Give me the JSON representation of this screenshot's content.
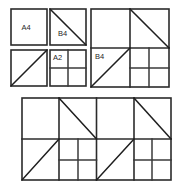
{
  "figure": {
    "background_color": "#ffffff",
    "stroke_color": "#2b2b2b",
    "label_color": "#262626",
    "width": 179,
    "height": 191,
    "labels": {
      "a4": "A4",
      "b4_small": "B4",
      "a2": "A2",
      "b4_large": "B4"
    },
    "groups": [
      {
        "name": "top-left-group",
        "cells": [
          {
            "name": "a4-square",
            "label": "A4",
            "diagonal": "none"
          },
          {
            "name": "b4-small-square",
            "label": "B4",
            "diagonal": "tl-br"
          },
          {
            "name": "plain-diagonal-square",
            "label": "",
            "diagonal": "bl-tr"
          },
          {
            "name": "a2-square",
            "label": "A2",
            "diagonal": "none",
            "subdivision": "quad"
          }
        ]
      },
      {
        "name": "b4-large-group",
        "cells": [
          {
            "name": "quadrant-top-left",
            "label": "",
            "diagonal": "none"
          },
          {
            "name": "quadrant-top-right",
            "label": "",
            "diagonal": "tl-br"
          },
          {
            "name": "quadrant-bottom-left",
            "label": "B4",
            "diagonal": "bl-tr"
          },
          {
            "name": "quadrant-bottom-right",
            "label": "",
            "diagonal": "none",
            "subdivision": "quad-partial"
          }
        ]
      },
      {
        "name": "bottom-panel-left-half",
        "cells": [
          {
            "name": "quadrant-top-left",
            "label": "",
            "diagonal": "none"
          },
          {
            "name": "quadrant-top-right",
            "label": "",
            "diagonal": "tl-br"
          },
          {
            "name": "quadrant-bottom-left",
            "label": "",
            "diagonal": "bl-tr"
          },
          {
            "name": "quadrant-bottom-right",
            "label": "",
            "diagonal": "none",
            "subdivision": "quad-partial"
          }
        ]
      },
      {
        "name": "bottom-panel-right-half",
        "cells": [
          {
            "name": "quadrant-top-left",
            "label": "",
            "diagonal": "none"
          },
          {
            "name": "quadrant-top-right",
            "label": "",
            "diagonal": "tl-br"
          },
          {
            "name": "quadrant-bottom-left",
            "label": "",
            "diagonal": "bl-tr"
          },
          {
            "name": "quadrant-bottom-right",
            "label": "",
            "diagonal": "none",
            "subdivision": "quad"
          }
        ]
      }
    ]
  }
}
